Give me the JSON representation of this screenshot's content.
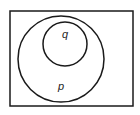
{
  "diagram": {
    "type": "venn",
    "universe": {
      "x": 10,
      "y": 11,
      "width": 123,
      "height": 95
    },
    "sets": [
      {
        "id": "p",
        "label": "p",
        "cx": 61,
        "cy": 59,
        "r": 43,
        "label_x": 61,
        "label_y": 90
      },
      {
        "id": "q",
        "label": "q",
        "cx": 65,
        "cy": 44,
        "r": 22,
        "label_x": 65,
        "label_y": 38
      }
    ],
    "relation": "q is a subset of p",
    "stroke_color": "#1a1a1a"
  }
}
